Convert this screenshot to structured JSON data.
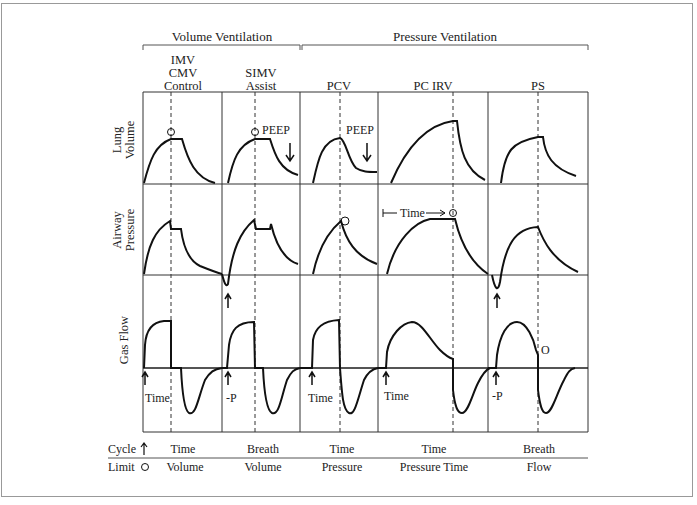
{
  "groups": [
    {
      "label": "Volume Ventilation"
    },
    {
      "label": "Pressure Ventilation"
    }
  ],
  "modes": [
    {
      "lines": [
        "IMV",
        "CMV",
        "Control"
      ],
      "cycle": "Time",
      "limit": "Volume"
    },
    {
      "lines": [
        "SIMV",
        "Assist"
      ],
      "cycle": "Breath",
      "limit": "Volume"
    },
    {
      "lines": [
        "PCV"
      ],
      "cycle": "Time",
      "limit": "Pressure"
    },
    {
      "lines": [
        "PC IRV"
      ],
      "cycle": "Time",
      "limit": "Pressure Time"
    },
    {
      "lines": [
        "PS"
      ],
      "cycle": "Breath",
      "limit": "Flow"
    }
  ],
  "rows": [
    {
      "lines": [
        "Lung",
        "Volume"
      ]
    },
    {
      "lines": [
        "Airway",
        "Pressure"
      ]
    },
    {
      "lines": [
        "Gas Flow"
      ]
    }
  ],
  "annotations": {
    "peep": "PEEP",
    "time_arrow": "Time",
    "trigger_time": "Time",
    "trigger_pressure": "-P",
    "limit_marker": "O"
  },
  "footer": {
    "cycle_label": "Cycle",
    "limit_label": "Limit"
  }
}
